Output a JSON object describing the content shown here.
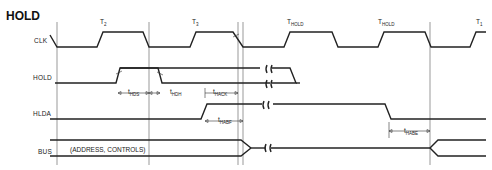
{
  "title": "HOLD",
  "signals": [
    {
      "name": "CLK"
    },
    {
      "name": "HOLD"
    },
    {
      "name": "HLDA"
    },
    {
      "name": "BUS"
    }
  ],
  "states": [
    {
      "label": "T",
      "sub": "2"
    },
    {
      "label": "T",
      "sub": "3"
    },
    {
      "label": "T",
      "sub": "HOLD"
    },
    {
      "label": "T",
      "sub": "HOLD"
    },
    {
      "label": "T",
      "sub": "1"
    }
  ],
  "timings": [
    {
      "label": "t",
      "sub": "HDS"
    },
    {
      "label": "t",
      "sub": "HDH"
    },
    {
      "label": "t",
      "sub": "HACK"
    },
    {
      "label": "t",
      "sub": "HABF"
    },
    {
      "label": "t",
      "sub": "HABE"
    }
  ],
  "bus_label": "(ADDRESS, CONTROLS)"
}
